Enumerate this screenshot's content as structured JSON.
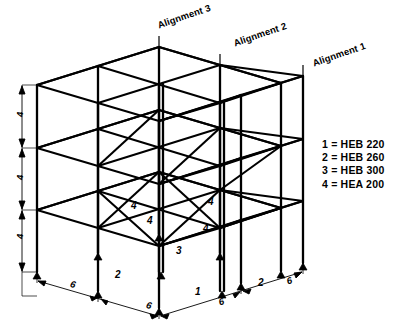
{
  "figure": {
    "type": "isometric-structural-frame",
    "stories": 3,
    "bays_x": 2,
    "bays_y": 2
  },
  "alignments": [
    {
      "name": "alignment-3",
      "label": "Alignment 3",
      "x": 156,
      "y": 20,
      "rotation": -19
    },
    {
      "name": "alignment-2",
      "label": "Alignment 2",
      "x": 232,
      "y": 38,
      "rotation": -19
    },
    {
      "name": "alignment-1",
      "label": "Alignment 1",
      "x": 311,
      "y": 58,
      "rotation": -19
    }
  ],
  "legend": {
    "title": "",
    "rows": [
      {
        "key": "1",
        "equals": "=",
        "section": "HEB 220",
        "text": "1 = HEB 220"
      },
      {
        "key": "2",
        "equals": "=",
        "section": "HEB 260",
        "text": "2 = HEB 260"
      },
      {
        "key": "3",
        "equals": "=",
        "section": "HEB 300",
        "text": "3 = HEB 300"
      },
      {
        "key": "4",
        "equals": "=",
        "section": "HEA 200",
        "text": "4 = HEA 200"
      }
    ]
  },
  "member_labels": [
    {
      "name": "member-label-brace-a",
      "text": "4",
      "x": 131,
      "y": 200
    },
    {
      "name": "member-label-brace-b",
      "text": "4",
      "x": 147,
      "y": 215
    },
    {
      "name": "member-label-brace-c",
      "text": "4",
      "x": 208,
      "y": 196
    },
    {
      "name": "member-label-brace-d",
      "text": "4",
      "x": 203,
      "y": 223
    },
    {
      "name": "member-label-column-3",
      "text": "3",
      "x": 176,
      "y": 245
    },
    {
      "name": "member-label-column-1",
      "text": "1",
      "x": 195,
      "y": 286
    },
    {
      "name": "member-label-column-2-left",
      "text": "2",
      "x": 115,
      "y": 269
    },
    {
      "name": "member-label-column-2-right",
      "text": "2",
      "x": 258,
      "y": 277
    }
  ],
  "dimensions": {
    "horizontal": [
      {
        "name": "dim-bay-left-rear",
        "value": "6",
        "x": 72,
        "y": 278
      },
      {
        "name": "dim-bay-left-front",
        "value": "6",
        "x": 148,
        "y": 299
      },
      {
        "name": "dim-bay-right-front",
        "value": "6",
        "x": 217,
        "y": 297
      },
      {
        "name": "dim-bay-right-rear",
        "value": "6",
        "x": 285,
        "y": 276
      }
    ],
    "vertical": [
      {
        "name": "dim-storey-3",
        "value": "4",
        "x": 14,
        "y": 117
      },
      {
        "name": "dim-storey-2",
        "value": "4",
        "x": 14,
        "y": 180
      },
      {
        "name": "dim-storey-1",
        "value": "4",
        "x": 14,
        "y": 239
      }
    ],
    "units_note": ""
  }
}
